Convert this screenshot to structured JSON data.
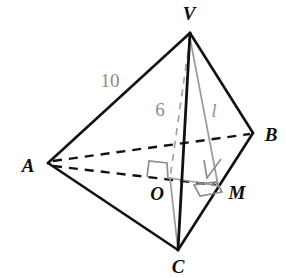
{
  "figure": {
    "background_color": "#ffffff",
    "edge_color": "#111111",
    "auxiliary_color": "#9a9a9a",
    "label_color": "#0d0d0d",
    "measure_color": "#8c8c8c"
  },
  "vertices": [
    {
      "name": "V",
      "label": "V",
      "x": 190,
      "y": 33,
      "label_x": 189,
      "label_y": 18
    },
    {
      "name": "A",
      "label": "A",
      "x": 48,
      "y": 163,
      "label_x": 28,
      "label_y": 170
    },
    {
      "name": "B",
      "label": "B",
      "x": 253,
      "y": 133,
      "label_x": 270,
      "label_y": 141
    },
    {
      "name": "C",
      "label": "C",
      "x": 178,
      "y": 250,
      "label_x": 178,
      "label_y": 272
    }
  ],
  "points": [
    {
      "name": "O",
      "label": "O",
      "x": 170,
      "y": 178,
      "label_x": 156,
      "label_y": 199,
      "description": "foot of altitude from V onto base plane"
    },
    {
      "name": "M",
      "label": "M",
      "x": 218,
      "y": 185,
      "label_x": 236,
      "label_y": 198,
      "description": "foot of perpendicular from O onto BC"
    }
  ],
  "edges": [
    {
      "name": "VA",
      "from": "V",
      "to": "A",
      "style": "solid"
    },
    {
      "name": "VB",
      "from": "V",
      "to": "B",
      "style": "solid"
    },
    {
      "name": "VC",
      "from": "V",
      "to": "C",
      "style": "solid"
    },
    {
      "name": "AC",
      "from": "A",
      "to": "C",
      "style": "solid"
    },
    {
      "name": "BC",
      "from": "B",
      "to": "C",
      "style": "solid"
    },
    {
      "name": "AB",
      "from": "A",
      "to": "B",
      "style": "dashed"
    }
  ],
  "auxiliary_lines": [
    {
      "name": "AM",
      "from": "A",
      "to": "M",
      "style": "dashed",
      "color": "black",
      "description": "base line from A through O to M"
    },
    {
      "name": "VO",
      "from": "V",
      "to": "O",
      "style": "dashed",
      "color": "gray",
      "description": "altitude of the pyramid"
    },
    {
      "name": "VM",
      "from": "V",
      "to": "M",
      "style": "solid",
      "color": "gray",
      "description": "slant height"
    },
    {
      "name": "OM",
      "from": "O",
      "to": "M",
      "style": "solid",
      "color": "gray",
      "description": "apothem in base plane"
    }
  ],
  "measures": [
    {
      "name": "lateral-edge-length",
      "text": "10",
      "x": 110,
      "y": 86,
      "style": "upright",
      "on_segment": "VA"
    },
    {
      "name": "altitude-length",
      "text": "6",
      "x": 160,
      "y": 115,
      "style": "upright",
      "on_segment": "VO"
    },
    {
      "name": "slant-height-length",
      "text": "l",
      "x": 214,
      "y": 116,
      "style": "italic",
      "on_segment": "VM"
    }
  ],
  "right_angles": [
    {
      "name": "right-angle-at-O",
      "at": "O",
      "between": [
        "VO",
        "AM"
      ]
    },
    {
      "name": "right-angle-at-M-vertical",
      "at": "M",
      "between": [
        "VM",
        "BC"
      ]
    },
    {
      "name": "right-angle-at-M-base",
      "at": "M",
      "between": [
        "OM",
        "BC"
      ]
    }
  ]
}
